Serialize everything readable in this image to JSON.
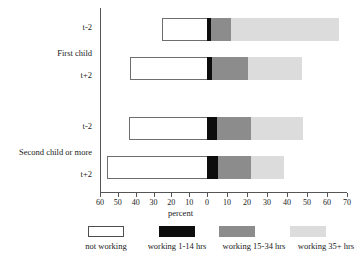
{
  "chart_data": {
    "type": "bar",
    "orientation": "horizontal",
    "stacked": true,
    "title": "",
    "xlabel": "percent",
    "ylabel": "",
    "xlim": [
      -60,
      70
    ],
    "grid": false,
    "legend_position": "bottom",
    "note": "Bars are stacked diverging: 'not working' extends left of zero; working categories extend right of zero.",
    "xticks": [
      {
        "label": "60",
        "value": -60
      },
      {
        "label": "50",
        "value": -50
      },
      {
        "label": "40",
        "value": -40
      },
      {
        "label": "30",
        "value": -30
      },
      {
        "label": "20",
        "value": -20
      },
      {
        "label": "10",
        "value": -10
      },
      {
        "label": "0",
        "value": 0
      },
      {
        "label": "10",
        "value": 10
      },
      {
        "label": "20",
        "value": 20
      },
      {
        "label": "30",
        "value": 30
      },
      {
        "label": "40",
        "value": 40
      },
      {
        "label": "50",
        "value": 50
      },
      {
        "label": "60",
        "value": 60
      },
      {
        "label": "70",
        "value": 70
      }
    ],
    "groups": [
      {
        "label": "First child",
        "categories": [
          "t-2",
          "t+2"
        ]
      },
      {
        "label": "Second child or more",
        "categories": [
          "t-2",
          "t+2"
        ]
      }
    ],
    "series": [
      {
        "name": "not working",
        "color": "#ffffff",
        "values": [
          25,
          43,
          44,
          56
        ]
      },
      {
        "name": "working 1-14 hrs",
        "color": "#0d0d0d",
        "values": [
          2,
          2.5,
          5,
          5.5
        ]
      },
      {
        "name": "working 15-34 hrs",
        "color": "#8c8c8c",
        "values": [
          10,
          18,
          17,
          16.5
        ]
      },
      {
        "name": "working 35+ hrs",
        "color": "#dcdcdc",
        "values": [
          54,
          27,
          26,
          16.5
        ]
      }
    ],
    "bars": [
      {
        "group": "First child",
        "category": "t-2",
        "not_working": 25,
        "working_1_14": 2,
        "working_15_34": 10,
        "working_35_plus": 54
      },
      {
        "group": "First child",
        "category": "t+2",
        "not_working": 43,
        "working_1_14": 2.5,
        "working_15_34": 18,
        "working_35_plus": 27
      },
      {
        "group": "Second child or more",
        "category": "t-2",
        "not_working": 44,
        "working_1_14": 5,
        "working_15_34": 17,
        "working_35_plus": 26
      },
      {
        "group": "Second child or more",
        "category": "t+2",
        "not_working": 56,
        "working_1_14": 5.5,
        "working_15_34": 16.5,
        "working_35_plus": 16.5
      }
    ],
    "legend": [
      {
        "label": "not working",
        "color": "#ffffff"
      },
      {
        "label": "working 1-14 hrs",
        "color": "#0d0d0d"
      },
      {
        "label": "working 15-34 hrs",
        "color": "#8c8c8c"
      },
      {
        "label": "working 35+ hrs",
        "color": "#dcdcdc"
      }
    ]
  }
}
